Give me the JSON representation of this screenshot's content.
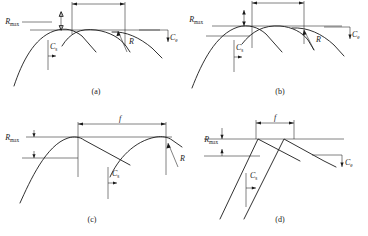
{
  "figure": {
    "background_color": "#ffffff",
    "line_color": "#1a1a1a"
  },
  "labels": {
    "rmax_symbol": "R",
    "rmax_subscript": "max",
    "feed_symbol": "f",
    "radius_symbol": "R",
    "cs_symbol": "C",
    "cs_subscript": "s",
    "ce_symbol": "C",
    "ce_subscript": "e"
  },
  "panels": [
    {
      "id": "a",
      "caption": "(a)",
      "profile_type": "round-nose-overlapping-arcs",
      "rmax_label": "R",
      "rmax_sub": "max",
      "feed_label": "f",
      "radius_label": "R",
      "cs_label": "C",
      "cs_sub": "s",
      "ce_label": "C",
      "ce_sub": "e",
      "rmax_relative": 0.26,
      "feed_relative": 0.4,
      "has_radius_arrow": true,
      "has_feed_dim": true
    },
    {
      "id": "b",
      "caption": "(b)",
      "profile_type": "round-nose-shallow-cusps",
      "rmax_label": "R",
      "rmax_sub": "max",
      "feed_label": "f",
      "radius_label": "R",
      "cs_label": "C",
      "cs_sub": "s",
      "ce_label": "C",
      "ce_sub": "e",
      "rmax_relative": 0.18,
      "feed_relative": 0.38,
      "has_radius_arrow": true,
      "has_feed_dim": true
    },
    {
      "id": "c",
      "caption": "(c)",
      "profile_type": "large-radius-wide-feed",
      "rmax_label": "R",
      "rmax_sub": "max",
      "feed_label": "f",
      "radius_label": "R",
      "cs_label": "C",
      "cs_sub": "s",
      "ce_label": "C",
      "ce_sub": "e",
      "rmax_relative": 0.3,
      "feed_relative": 0.62,
      "has_radius_arrow": true,
      "has_feed_dim": true
    },
    {
      "id": "d",
      "caption": "(d)",
      "profile_type": "sharp-nose-straight-flanks",
      "rmax_label": "R",
      "rmax_sub": "max",
      "feed_label": "f",
      "radius_label": "",
      "cs_label": "C",
      "cs_sub": "s",
      "ce_label": "C",
      "ce_sub": "e",
      "rmax_relative": 0.16,
      "feed_relative": 0.26,
      "has_radius_arrow": false,
      "has_feed_dim": true
    }
  ]
}
